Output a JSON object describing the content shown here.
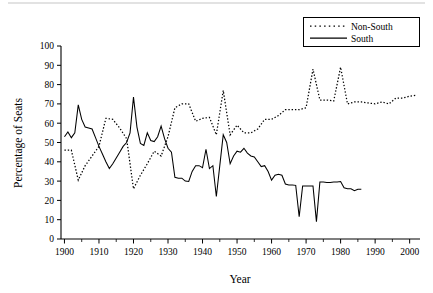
{
  "chart_data": {
    "type": "line",
    "title": "",
    "xlabel": "Year",
    "ylabel": "Percentage of Seats",
    "xlim": [
      1899,
      2003
    ],
    "ylim": [
      0,
      100
    ],
    "xticks": [
      1900,
      1910,
      1920,
      1930,
      1940,
      1950,
      1960,
      1970,
      1980,
      1990,
      2000
    ],
    "yticks": [
      0,
      10,
      20,
      30,
      40,
      50,
      60,
      70,
      80,
      90,
      100
    ],
    "minor_xticks": [
      1905,
      1915,
      1925,
      1935,
      1945,
      1955,
      1965,
      1975,
      1985,
      1995
    ],
    "grid": false,
    "legend_position": "top-right",
    "legend_entries": [
      "Non-South",
      "South"
    ],
    "x": [
      1900,
      1902,
      1904,
      1906,
      1908,
      1910,
      1912,
      1914,
      1916,
      1918,
      1920,
      1922,
      1924,
      1926,
      1928,
      1930,
      1932,
      1934,
      1936,
      1938,
      1940,
      1942,
      1944,
      1946,
      1948,
      1950,
      1952,
      1954,
      1956,
      1958,
      1960,
      1962,
      1964,
      1966,
      1968,
      1970,
      1972,
      1974,
      1976,
      1978,
      1980,
      1982,
      1984,
      1986,
      1988,
      1990,
      1992,
      1994,
      1996,
      1998,
      2000,
      2002
    ],
    "series": [
      {
        "name": "Non-South",
        "style": "dotted",
        "values": [
          46,
          46,
          30.5,
          38,
          43,
          48,
          62.5,
          62,
          57.5,
          52,
          26,
          33,
          39,
          45.5,
          43,
          53,
          68,
          70,
          70,
          61,
          62.5,
          63,
          54,
          77,
          54,
          59,
          55,
          55,
          57,
          62,
          62,
          64,
          67,
          67,
          67,
          68,
          88,
          72,
          72,
          71.5,
          89,
          70,
          71,
          71,
          70.5,
          70,
          71,
          70,
          73,
          73,
          74,
          74.5
        ]
      },
      {
        "name": "South",
        "style": "solid",
        "values": [
          53,
          55.5,
          52.5,
          69.5,
          58,
          57,
          52,
          44,
          36.5,
          42,
          48,
          73.5,
          49.5,
          51,
          55,
          50,
          51.5,
          58.5,
          47,
          45,
          32,
          31.5,
          31,
          30,
          38,
          38,
          37,
          46.5,
          36.5,
          22,
          54,
          50,
          39,
          43,
          45.5,
          45,
          47,
          44.5,
          43,
          42.5,
          40,
          37.5,
          35,
          30.5,
          33,
          33.5,
          33,
          11.5,
          27.5,
          27.5,
          27.5,
          9
        ]
      }
    ],
    "south_points": [
      [
        1900,
        53
      ],
      [
        1901,
        55.5
      ],
      [
        1902,
        52.5
      ],
      [
        1903,
        55
      ],
      [
        1904,
        69.5
      ],
      [
        1905,
        62
      ],
      [
        1906,
        58
      ],
      [
        1907,
        57.5
      ],
      [
        1908,
        57
      ],
      [
        1909,
        52.5
      ],
      [
        1910,
        48
      ],
      [
        1911,
        44
      ],
      [
        1912,
        40
      ],
      [
        1913,
        36.5
      ],
      [
        1914,
        39
      ],
      [
        1915,
        42
      ],
      [
        1916,
        45
      ],
      [
        1917,
        48
      ],
      [
        1918,
        50
      ],
      [
        1919,
        55
      ],
      [
        1920,
        73.5
      ],
      [
        1921,
        58
      ],
      [
        1922,
        49.5
      ],
      [
        1923,
        48.5
      ],
      [
        1924,
        55
      ],
      [
        1925,
        51
      ],
      [
        1926,
        50.5
      ],
      [
        1927,
        53
      ],
      [
        1928,
        58.5
      ],
      [
        1929,
        52
      ],
      [
        1930,
        47
      ],
      [
        1931,
        45
      ],
      [
        1932,
        32
      ],
      [
        1933,
        31.5
      ],
      [
        1934,
        31.5
      ],
      [
        1935,
        30
      ],
      [
        1936,
        29.8
      ],
      [
        1937,
        35
      ],
      [
        1938,
        38
      ],
      [
        1939,
        38
      ],
      [
        1940,
        37
      ],
      [
        1941,
        46.5
      ],
      [
        1942,
        36.5
      ],
      [
        1943,
        38
      ],
      [
        1944,
        22
      ],
      [
        1945,
        38
      ],
      [
        1946,
        54
      ],
      [
        1947,
        50
      ],
      [
        1948,
        39
      ],
      [
        1949,
        43
      ],
      [
        1950,
        45.5
      ],
      [
        1951,
        45
      ],
      [
        1952,
        47
      ],
      [
        1953,
        44.5
      ],
      [
        1954,
        43
      ],
      [
        1955,
        42.5
      ],
      [
        1956,
        40
      ],
      [
        1957,
        37.5
      ],
      [
        1958,
        38
      ],
      [
        1959,
        35
      ],
      [
        1960,
        30.5
      ],
      [
        1961,
        33
      ],
      [
        1962,
        33.5
      ],
      [
        1963,
        33
      ],
      [
        1964,
        28.5
      ],
      [
        1965,
        28
      ],
      [
        1966,
        28
      ],
      [
        1967,
        27.8
      ],
      [
        1968,
        11.5
      ],
      [
        1969,
        27.5
      ],
      [
        1970,
        27.5
      ],
      [
        1971,
        27.5
      ],
      [
        1972,
        27.5
      ],
      [
        1973,
        9
      ],
      [
        1974,
        29.5
      ],
      [
        1975,
        29.5
      ],
      [
        1976,
        29.3
      ],
      [
        1977,
        29.3
      ],
      [
        1978,
        29.5
      ],
      [
        1979,
        29.5
      ],
      [
        1980,
        29.8
      ],
      [
        1981,
        26.5
      ],
      [
        1982,
        26
      ],
      [
        1983,
        26
      ],
      [
        1984,
        25
      ],
      [
        1985,
        25.8
      ],
      [
        1986,
        25.8
      ]
    ],
    "annotations": [
      {
        "text": "South peak 1920",
        "value": 73.5
      },
      {
        "text": "South trough 1944",
        "value": 22
      },
      {
        "text": "Non-South peak 1972",
        "value": 88
      },
      {
        "text": "Non-South peak 1980",
        "value": 89
      }
    ]
  },
  "axes": {
    "xlabel": "Year",
    "ylabel": "Percentage of Seats",
    "ytick_labels": [
      "100",
      "90",
      "80",
      "70",
      "60",
      "50",
      "40",
      "30",
      "20",
      "10",
      "0"
    ],
    "xtick_labels": [
      "1900",
      "1910",
      "1920",
      "1930",
      "1940",
      "1950",
      "1960",
      "1970",
      "1980",
      "1990",
      "2000"
    ]
  },
  "legend": {
    "items": [
      {
        "label": "Non-South",
        "style": "dotted"
      },
      {
        "label": "South",
        "style": "solid"
      }
    ]
  }
}
